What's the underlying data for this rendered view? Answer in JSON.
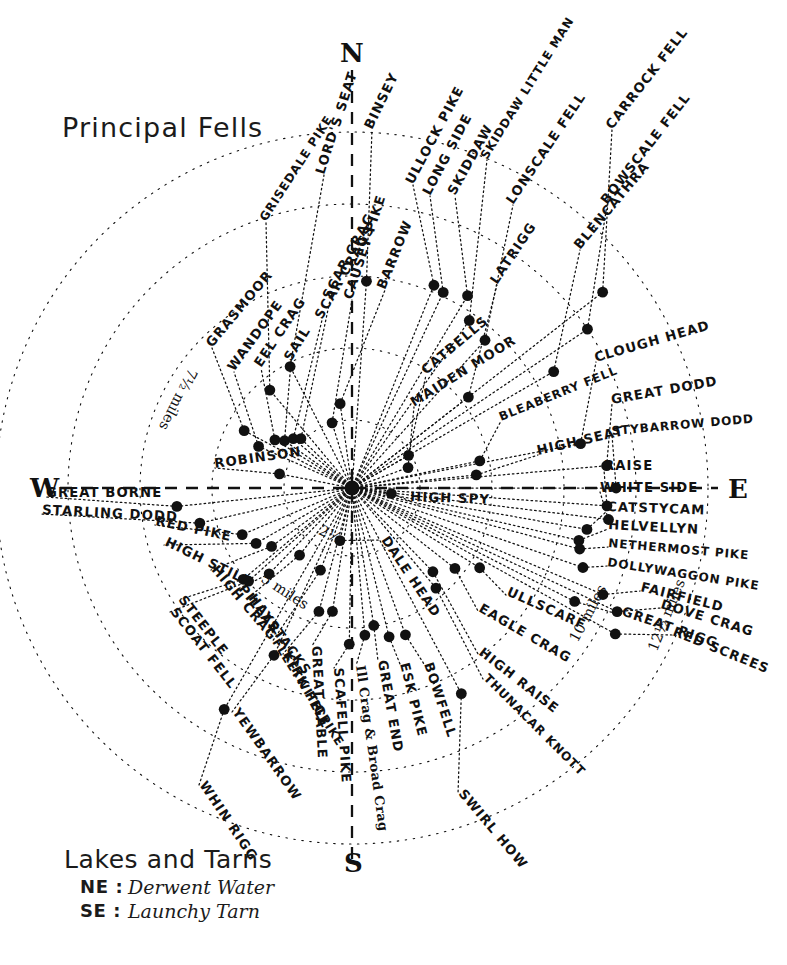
{
  "title": "Principal Fells",
  "cardinals": {
    "n": "N",
    "e": "E",
    "s": "S",
    "w": "W"
  },
  "legend": {
    "heading": "Lakes and Tarns",
    "rows": [
      {
        "key": "NE :",
        "value": "Derwent Water"
      },
      {
        "key": "SE :",
        "value": "Launchy Tarn"
      }
    ]
  },
  "rings": [
    {
      "label": "2½",
      "radius": 68
    },
    {
      "label": "5 miles",
      "radius": 140
    },
    {
      "label": "7½ miles",
      "radius": 212
    },
    {
      "label": "10 miles",
      "radius": 284
    },
    {
      "label": "12½ miles",
      "radius": 356
    }
  ],
  "center": {
    "x": 352,
    "y": 488
  },
  "chart_data": {
    "type": "scatter",
    "title": "Principal Fells",
    "subtitle": "Radial panorama of Lake District fells with distance rings",
    "xlabel": "",
    "ylabel": "",
    "grid": "polar radial rings and rays",
    "legend_position": "bottom-left",
    "center_px": [
      352,
      488
    ],
    "radial_axis_units": "miles",
    "radial_ticks": [
      2.5,
      5,
      7.5,
      10,
      12.5
    ],
    "angle_convention": "0° = North, clockwise positive",
    "points": [
      {
        "name": "BINSEY",
        "angle": 4,
        "miles": 7.3,
        "label_angle": -64,
        "lx": 372,
        "ly": 130
      },
      {
        "name": "ULLOCK PIKE",
        "angle": 22,
        "miles": 7.7,
        "label_angle": -62,
        "lx": 413,
        "ly": 185
      },
      {
        "name": "LONG SIDE",
        "angle": 25,
        "miles": 7.6,
        "label_angle": -62,
        "lx": 430,
        "ly": 196
      },
      {
        "name": "SKIDDAW",
        "angle": 31,
        "miles": 7.9,
        "label_angle": -61,
        "lx": 455,
        "ly": 196
      },
      {
        "name": "SKIDDAW LITTLE MAN",
        "angle": 35,
        "miles": 7.2,
        "label_angle": -58,
        "lx": 487,
        "ly": 160
      },
      {
        "name": "LONSCALE FELL",
        "angle": 42,
        "miles": 7.0,
        "label_angle": -56,
        "lx": 513,
        "ly": 205
      },
      {
        "name": "CARROCK FELL",
        "angle": 52,
        "miles": 11.2,
        "label_angle": -52,
        "lx": 612,
        "ly": 130
      },
      {
        "name": "BOWSCALE FELL",
        "angle": 56,
        "miles": 10.0,
        "label_angle": -52,
        "lx": 607,
        "ly": 205
      },
      {
        "name": "BLENCATHRA",
        "angle": 60,
        "miles": 8.2,
        "label_angle": -50,
        "lx": 580,
        "ly": 250
      },
      {
        "name": "LATRIGG",
        "angle": 52,
        "miles": 5.2,
        "label_angle": -56,
        "lx": 497,
        "ly": 285
      },
      {
        "name": "CLOUGH HEAD",
        "angle": 79,
        "miles": 8.2,
        "label_angle": -16,
        "lx": 596,
        "ly": 362
      },
      {
        "name": "GREAT DODD",
        "angle": 85,
        "miles": 9.0,
        "label_angle": -10,
        "lx": 612,
        "ly": 404
      },
      {
        "name": "STYBARROW DODD",
        "angle": 90,
        "miles": 9.3,
        "label_angle": -5,
        "lx": 612,
        "ly": 435
      },
      {
        "name": "RAISE",
        "angle": 94,
        "miles": 9.0,
        "label_angle": 0,
        "lx": 604,
        "ly": 470
      },
      {
        "name": "WHITE SIDE",
        "angle": 97,
        "miles": 9.1,
        "label_angle": 0,
        "lx": 600,
        "ly": 492
      },
      {
        "name": "CATSTYCAM",
        "angle": 100,
        "miles": 8.4,
        "label_angle": 2,
        "lx": 607,
        "ly": 511
      },
      {
        "name": "HELVELLYN",
        "angle": 103,
        "miles": 8.2,
        "label_angle": 3,
        "lx": 608,
        "ly": 529
      },
      {
        "name": "NETHERMOST PIKE",
        "angle": 105,
        "miles": 8.3,
        "label_angle": 5,
        "lx": 608,
        "ly": 547
      },
      {
        "name": "DOLLYWAGGON PIKE",
        "angle": 109,
        "miles": 8.6,
        "label_angle": 9,
        "lx": 607,
        "ly": 566
      },
      {
        "name": "FAIRFIELD",
        "angle": 113,
        "miles": 9.6,
        "label_angle": 14,
        "lx": 640,
        "ly": 591
      },
      {
        "name": "DOVE CRAG",
        "angle": 115,
        "miles": 10.3,
        "label_angle": 17,
        "lx": 660,
        "ly": 608
      },
      {
        "name": "GREAT RIGG",
        "angle": 117,
        "miles": 8.8,
        "label_angle": 19,
        "lx": 621,
        "ly": 615
      },
      {
        "name": "RED SCREES",
        "angle": 119,
        "miles": 10.6,
        "label_angle": 22,
        "lx": 672,
        "ly": 635
      },
      {
        "name": "BLEABERRY FELL",
        "angle": 78,
        "miles": 4.6,
        "label_angle": -22,
        "lx": 501,
        "ly": 421
      },
      {
        "name": "HIGH SEAT",
        "angle": 84,
        "miles": 4.4,
        "label_angle": -13,
        "lx": 538,
        "ly": 455
      },
      {
        "name": "MAIDEN MOOR",
        "angle": 70,
        "miles": 2.1,
        "label_angle": -32,
        "lx": 414,
        "ly": 407
      },
      {
        "name": "CATBELLS",
        "angle": 60,
        "miles": 2.3,
        "label_angle": -40,
        "lx": 426,
        "ly": 375
      },
      {
        "name": "HIGH SPY",
        "angle": 98,
        "miles": 1.4,
        "label_angle": 2,
        "lx": 410,
        "ly": 501
      },
      {
        "name": "ULLSCARF",
        "angle": 122,
        "miles": 5.3,
        "label_angle": 24,
        "lx": 506,
        "ly": 595
      },
      {
        "name": "EAGLE CRAG",
        "angle": 128,
        "miles": 4.6,
        "label_angle": 30,
        "lx": 478,
        "ly": 611
      },
      {
        "name": "HIGH RAISE",
        "angle": 136,
        "miles": 4.1,
        "label_angle": 38,
        "lx": 478,
        "ly": 654
      },
      {
        "name": "THUNACAR KNOTT",
        "angle": 140,
        "miles": 4.6,
        "label_angle": 45,
        "lx": 483,
        "ly": 679
      },
      {
        "name": "SWIRL HOW",
        "angle": 152,
        "miles": 8.2,
        "label_angle": 50,
        "lx": 458,
        "ly": 794
      },
      {
        "name": "BOWFELL",
        "angle": 160,
        "miles": 5.5,
        "label_angle": 72,
        "lx": 424,
        "ly": 664
      },
      {
        "name": "ESK PIKE",
        "angle": 166,
        "miles": 5.4,
        "label_angle": 76,
        "lx": 400,
        "ly": 664
      },
      {
        "name": "GREAT END",
        "angle": 171,
        "miles": 4.9,
        "label_angle": 80,
        "lx": 378,
        "ly": 661
      },
      {
        "name": "Ill Crag & Broad Crag",
        "angle": 175,
        "miles": 5.2,
        "label_angle": 82,
        "lx": 356,
        "ly": 666
      },
      {
        "name": "SCAFELL PIKE",
        "angle": 181,
        "miles": 5.5,
        "label_angle": 86,
        "lx": 334,
        "ly": 668
      },
      {
        "name": "GREAT GABLE",
        "angle": 189,
        "miles": 4.4,
        "label_angle": 87,
        "lx": 312,
        "ly": 646
      },
      {
        "name": "KIRK FELL",
        "angle": 195,
        "miles": 4.5,
        "label_angle": 62,
        "lx": 283,
        "ly": 654
      },
      {
        "name": "FLEETWITH PIKE",
        "angle": 201,
        "miles": 3.1,
        "label_angle": 58,
        "lx": 272,
        "ly": 642
      },
      {
        "name": "YEWBARROW",
        "angle": 205,
        "miles": 6.5,
        "label_angle": 55,
        "lx": 232,
        "ly": 712
      },
      {
        "name": "WHIN RIGG",
        "angle": 210,
        "miles": 9.0,
        "label_angle": 56,
        "lx": 199,
        "ly": 785
      },
      {
        "name": "HAYSTACKS",
        "angle": 218,
        "miles": 3.0,
        "label_angle": 54,
        "lx": 248,
        "ly": 598
      },
      {
        "name": "PILLAR",
        "angle": 224,
        "miles": 4.2,
        "label_angle": 52,
        "lx": 238,
        "ly": 589
      },
      {
        "name": "SCOAT FELL",
        "angle": 228,
        "miles": 4.9,
        "label_angle": 52,
        "lx": 170,
        "ly": 612
      },
      {
        "name": "STEEPLE",
        "angle": 230,
        "miles": 5.0,
        "label_angle": 52,
        "lx": 178,
        "ly": 600
      },
      {
        "name": "HIGH CRAG",
        "angle": 234,
        "miles": 3.5,
        "label_angle": 50,
        "lx": 211,
        "ly": 570
      },
      {
        "name": "HIGH STILE",
        "angle": 240,
        "miles": 3.9,
        "label_angle": 26,
        "lx": 164,
        "ly": 545
      },
      {
        "name": "RED PIKE",
        "angle": 247,
        "miles": 4.2,
        "label_angle": 12,
        "lx": 155,
        "ly": 525
      },
      {
        "name": "STARLING DODD",
        "angle": 257,
        "miles": 5.5,
        "label_angle": 3,
        "lx": 42,
        "ly": 514
      },
      {
        "name": "GREAT BORNE",
        "angle": 264,
        "miles": 6.2,
        "label_angle": 0,
        "lx": 46,
        "ly": 497
      },
      {
        "name": "ROBINSON",
        "angle": 281,
        "miles": 2.6,
        "label_angle": -8,
        "lx": 215,
        "ly": 468
      },
      {
        "name": "WANDOPE",
        "angle": 294,
        "miles": 3.6,
        "label_angle": -54,
        "lx": 234,
        "ly": 372
      },
      {
        "name": "GRASMOOR",
        "angle": 298,
        "miles": 4.3,
        "label_angle": -50,
        "lx": 212,
        "ly": 348
      },
      {
        "name": "EEL CRAG",
        "angle": 302,
        "miles": 3.2,
        "label_angle": -56,
        "lx": 261,
        "ly": 368
      },
      {
        "name": "SAIL",
        "angle": 305,
        "miles": 2.9,
        "label_angle": -58,
        "lx": 291,
        "ly": 362
      },
      {
        "name": "SCAR CRAGS",
        "angle": 310,
        "miles": 2.7,
        "label_angle": -60,
        "lx": 322,
        "ly": 320
      },
      {
        "name": "GRISEDALE PIKE",
        "angle": 320,
        "miles": 4.5,
        "label_angle": -57,
        "lx": 266,
        "ly": 222
      },
      {
        "name": "SCAR CRAG",
        "angle": 314,
        "miles": 2.5,
        "label_angle": -62,
        "lx": 330,
        "ly": 300
      },
      {
        "name": "LORD'S SEAT",
        "angle": 333,
        "miles": 4.8,
        "label_angle": -72,
        "lx": 324,
        "ly": 175
      },
      {
        "name": "CAUSEY PIKE",
        "angle": 343,
        "miles": 2.4,
        "label_angle": -72,
        "lx": 352,
        "ly": 300
      },
      {
        "name": "BARROW",
        "angle": 352,
        "miles": 3.0,
        "label_angle": -68,
        "lx": 385,
        "ly": 290
      },
      {
        "name": "DALE HEAD",
        "angle": 193,
        "miles": 1.9,
        "label_angle": 56,
        "lx": 381,
        "ly": 540
      }
    ]
  }
}
